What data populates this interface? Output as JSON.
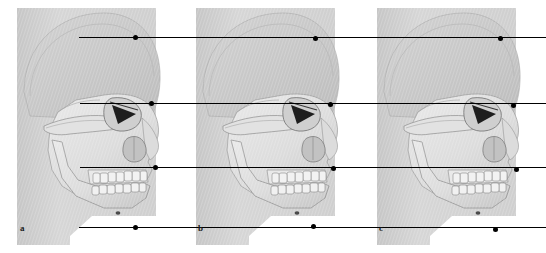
{
  "figure": {
    "width": 546,
    "height": 253,
    "background_color": "#ffffff"
  },
  "colors": {
    "background": "#ffffff",
    "backdrop_gray": "#d4d4d4",
    "backdrop_gray_dark": "#bfbfbf",
    "bone_light": "#ededed",
    "bone_mid": "#d8d8d8",
    "bone_shadow": "#b4b4b4",
    "outline": "#6e6e6e",
    "line": "#000000",
    "marker": "#000000",
    "label_text": "#1a1a1a"
  },
  "panels": [
    {
      "id": "panel-a",
      "label": "a",
      "label_x": 20,
      "label_y": 224,
      "x": 16,
      "width": 170,
      "backdrop": {
        "x": 16,
        "y": 8,
        "width": 140,
        "height": 237
      }
    },
    {
      "id": "panel-b",
      "label": "b",
      "label_x": 198,
      "label_y": 224,
      "x": 195,
      "width": 170,
      "backdrop": {
        "x": 195,
        "y": 8,
        "width": 140,
        "height": 237
      }
    },
    {
      "id": "panel-c",
      "label": "c",
      "label_x": 379,
      "label_y": 224,
      "x": 376,
      "width": 170,
      "backdrop": {
        "x": 376,
        "y": 8,
        "width": 140,
        "height": 237
      }
    }
  ],
  "reference_lines": [
    {
      "id": "line-1",
      "name": "superior-reference-line",
      "y": 37,
      "x_start": 79,
      "x_end": 546,
      "markers": [
        {
          "x": 135,
          "y": 37
        },
        {
          "x": 315,
          "y": 38
        },
        {
          "x": 500,
          "y": 38
        }
      ]
    },
    {
      "id": "line-2",
      "name": "orbital-reference-line",
      "y": 103,
      "x_start": 80,
      "x_end": 546,
      "markers": [
        {
          "x": 151,
          "y": 103
        },
        {
          "x": 330,
          "y": 104
        },
        {
          "x": 513,
          "y": 105
        }
      ]
    },
    {
      "id": "line-3",
      "name": "subnasal-reference-line",
      "y": 167,
      "x_start": 80,
      "x_end": 546,
      "markers": [
        {
          "x": 155,
          "y": 167
        },
        {
          "x": 333,
          "y": 168
        },
        {
          "x": 516,
          "y": 169
        }
      ]
    },
    {
      "id": "line-4",
      "name": "menton-reference-line",
      "y": 227,
      "x_start": 79,
      "x_end": 546,
      "markers": [
        {
          "x": 135,
          "y": 227
        },
        {
          "x": 313,
          "y": 226
        },
        {
          "x": 495,
          "y": 229
        }
      ]
    }
  ]
}
